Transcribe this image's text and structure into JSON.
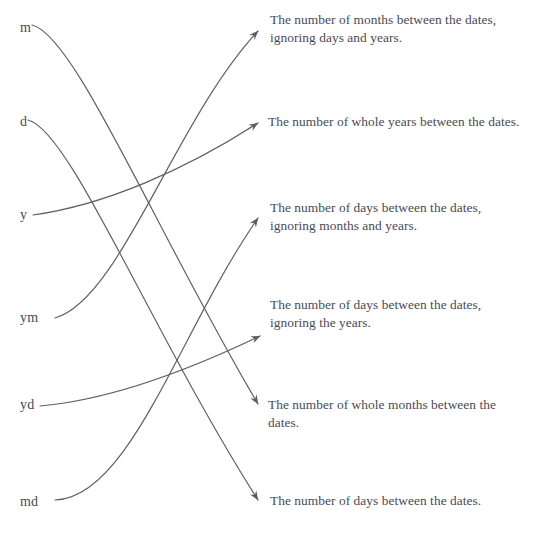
{
  "diagram": {
    "stroke_color": "#5d5d66",
    "text_color": "#4a4a52",
    "background_color": "#ffffff",
    "left_items": [
      {
        "id": "m",
        "label": "m",
        "x": 20,
        "y": 28
      },
      {
        "id": "d",
        "label": "d",
        "x": 20,
        "y": 122
      },
      {
        "id": "y",
        "label": "y",
        "x": 20,
        "y": 215
      },
      {
        "id": "ym",
        "label": "ym",
        "x": 20,
        "y": 318
      },
      {
        "id": "yd",
        "label": "yd",
        "x": 20,
        "y": 405
      },
      {
        "id": "md",
        "label": "md",
        "x": 20,
        "y": 502
      }
    ],
    "right_items": [
      {
        "id": "r1",
        "label": "The number of months between the dates, ignoring days and years.",
        "x": 270,
        "y": 12
      },
      {
        "id": "r2",
        "label": "The number of whole years between the dates.",
        "x": 268,
        "y": 114
      },
      {
        "id": "r3",
        "label": "The number of days between the dates, ignoring months and years.",
        "x": 270,
        "y": 200
      },
      {
        "id": "r4",
        "label": "The number of days between the dates, ignoring the years.",
        "x": 270,
        "y": 297
      },
      {
        "id": "r5",
        "label": "The number of whole months between the dates.",
        "x": 268,
        "y": 397
      },
      {
        "id": "r6",
        "label": "The number of days between the dates.",
        "x": 270,
        "y": 493
      }
    ],
    "connections": [
      {
        "from": "ym",
        "to": "r1",
        "path": "M 55 318 C 120 300 175 120 258 31"
      },
      {
        "from": "y",
        "to": "r2",
        "path": "M 33 215 C 105 205 185 170 258 123"
      },
      {
        "from": "md",
        "to": "r3",
        "path": "M 55 500 C 130 498 180 330 258 218"
      },
      {
        "from": "yd",
        "to": "r4",
        "path": "M 40 406 C 110 400 185 370 260 335"
      },
      {
        "from": "m",
        "to": "r5",
        "path": "M 32 25 C 75 35 155 230 258 404"
      },
      {
        "from": "d",
        "to": "r6",
        "path": "M 28 120 C 70 130 150 330 258 500"
      }
    ],
    "arrow_tips": [
      {
        "id": "a1",
        "x": 265,
        "y": 28
      },
      {
        "id": "a2",
        "x": 265,
        "y": 122
      },
      {
        "id": "a3",
        "x": 265,
        "y": 215
      },
      {
        "id": "a4",
        "x": 267,
        "y": 332
      },
      {
        "id": "a5",
        "x": 265,
        "y": 405
      },
      {
        "id": "a6",
        "x": 265,
        "y": 501
      }
    ]
  }
}
